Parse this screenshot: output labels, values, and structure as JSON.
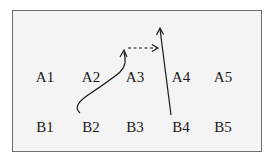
{
  "diagram": {
    "row_a": [
      {
        "id": "A1",
        "label": "A1",
        "x": 45,
        "y": 77
      },
      {
        "id": "A2",
        "label": "A2",
        "x": 91,
        "y": 77
      },
      {
        "id": "A3",
        "label": "A3",
        "x": 135,
        "y": 77
      },
      {
        "id": "A4",
        "label": "A4",
        "x": 181,
        "y": 77
      },
      {
        "id": "A5",
        "label": "A5",
        "x": 223,
        "y": 77
      }
    ],
    "row_b": [
      {
        "id": "B1",
        "label": "B1",
        "x": 45,
        "y": 127
      },
      {
        "id": "B2",
        "label": "B2",
        "x": 91,
        "y": 127
      },
      {
        "id": "B3",
        "label": "B3",
        "x": 135,
        "y": 127
      },
      {
        "id": "B4",
        "label": "B4",
        "x": 181,
        "y": 127
      },
      {
        "id": "B5",
        "label": "B5",
        "x": 223,
        "y": 127
      }
    ],
    "arrows": [
      {
        "name": "curved-arrow-from-B2",
        "style": "solid",
        "from": "B2",
        "to": "between A3 and above"
      },
      {
        "name": "dashed-arrow-horizontal",
        "style": "dashed",
        "from": "curve tip",
        "to": "B4 arrow"
      },
      {
        "name": "straight-arrow-from-B4",
        "style": "solid",
        "from": "B4",
        "to": "top"
      }
    ]
  }
}
